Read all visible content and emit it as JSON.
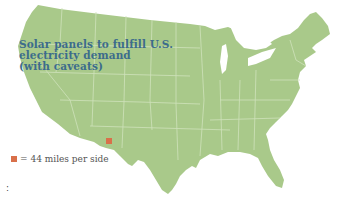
{
  "map": {
    "region": "Contiguous United States",
    "land_color": "#a9c98a",
    "border_color": "#cfe2bb",
    "background_color": "#ffffff"
  },
  "title": {
    "lines": [
      "Solar panels to fulfill U.S.",
      "electricity demand",
      "(with caveats)"
    ],
    "color": "#3c6c8c"
  },
  "marker": {
    "label": "solar-area-square",
    "color": "#d9704a",
    "location": "southern New Mexico"
  },
  "legend": {
    "symbol": "■",
    "text": "= 44 miles per side",
    "swatch_color": "#d9704a"
  },
  "footer": {
    "colon": ":"
  }
}
